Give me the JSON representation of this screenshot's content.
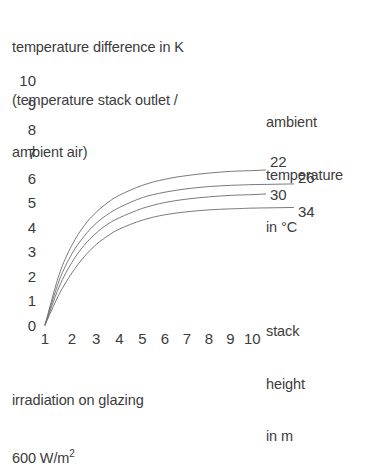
{
  "title": {
    "line1": "temperature difference in K",
    "line2": "(temperature stack outlet /",
    "line3": "ambient air)"
  },
  "legend_title": {
    "line1": "ambient",
    "line2": "temperature",
    "line3": "in °C"
  },
  "axis_title": {
    "line1": "stack",
    "line2": "height",
    "line3": "in m"
  },
  "footnote": {
    "line1": "irradiation on glazing",
    "line2_value": "600 W/m",
    "line2_exponent": "2"
  },
  "colors": {
    "curve": "#6b6b6b",
    "text": "#3b3b3b",
    "background": "#ffffff"
  },
  "chart_data": {
    "type": "line",
    "title": "temperature difference in K (temperature stack outlet / ambient air)",
    "xlabel": "stack height in m",
    "ylabel": "temperature difference in K",
    "legend_title": "ambient temperature in °C",
    "legend_position": "right-inline-at-curve-ends",
    "annotation": "irradiation on glazing 600 W/m2",
    "grid": false,
    "xlim": [
      1,
      10
    ],
    "ylim": [
      0,
      10
    ],
    "xticks": [
      1,
      2,
      3,
      4,
      5,
      6,
      7,
      8,
      9,
      10
    ],
    "yticks": [
      0,
      1,
      2,
      3,
      4,
      5,
      6,
      7,
      8,
      9,
      10
    ],
    "x": [
      1,
      1.5,
      2,
      2.5,
      3,
      3.5,
      4,
      5,
      6,
      7,
      8,
      9,
      10
    ],
    "series": [
      {
        "name": "22",
        "label": "22",
        "values": [
          0,
          2.05,
          3.25,
          4.05,
          4.6,
          5.0,
          5.3,
          5.7,
          5.95,
          6.1,
          6.2,
          6.27,
          6.3
        ]
      },
      {
        "name": "26",
        "label": "26",
        "values": [
          0,
          1.8,
          2.9,
          3.62,
          4.15,
          4.52,
          4.8,
          5.2,
          5.42,
          5.56,
          5.65,
          5.7,
          5.73
        ]
      },
      {
        "name": "30",
        "label": "30",
        "values": [
          0,
          1.55,
          2.55,
          3.25,
          3.75,
          4.12,
          4.38,
          4.76,
          5.0,
          5.14,
          5.23,
          5.29,
          5.32
        ]
      },
      {
        "name": "34",
        "label": "34",
        "values": [
          0,
          1.25,
          2.12,
          2.78,
          3.28,
          3.64,
          3.92,
          4.28,
          4.5,
          4.62,
          4.7,
          4.74,
          4.77
        ]
      }
    ]
  }
}
